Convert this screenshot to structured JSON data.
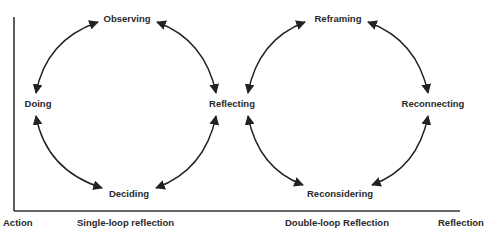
{
  "diagram": {
    "title": "",
    "single_loop": {
      "name": "Single-loop reflection",
      "nodes": [
        "Observing",
        "Reflecting",
        "Deciding",
        "Doing"
      ]
    },
    "double_loop": {
      "name": "Double-loop Reflection",
      "nodes": [
        "Reframing",
        "Reconnecting",
        "Reconsidering",
        "Reflecting"
      ]
    },
    "shared_node": "Reflecting",
    "edges": [
      {
        "from": "Doing",
        "to": "Observing",
        "bidirectional": true
      },
      {
        "from": "Observing",
        "to": "Reflecting",
        "bidirectional": true
      },
      {
        "from": "Reflecting",
        "to": "Deciding",
        "bidirectional": true
      },
      {
        "from": "Deciding",
        "to": "Doing",
        "bidirectional": true
      },
      {
        "from": "Reflecting",
        "to": "Reframing",
        "bidirectional": true
      },
      {
        "from": "Reframing",
        "to": "Reconnecting",
        "bidirectional": true
      },
      {
        "from": "Reconnecting",
        "to": "Reconsidering",
        "bidirectional": true
      },
      {
        "from": "Reconsidering",
        "to": "Reflecting",
        "bidirectional": true
      }
    ],
    "labels": {
      "observing": "Observing",
      "doing": "Doing",
      "reflecting": "Reflecting",
      "deciding": "Deciding",
      "reframing": "Reframing",
      "reconnecting": "Reconnecting",
      "reconsidering": "Reconsidering"
    },
    "axis": {
      "x_left": "Action",
      "x_right": "Reflection",
      "segment_single": "Single-loop reflection",
      "segment_double": "Double-loop Reflection"
    },
    "colors": {
      "stroke": "#222222",
      "text": "#2a2a2a",
      "background": "#ffffff"
    }
  }
}
